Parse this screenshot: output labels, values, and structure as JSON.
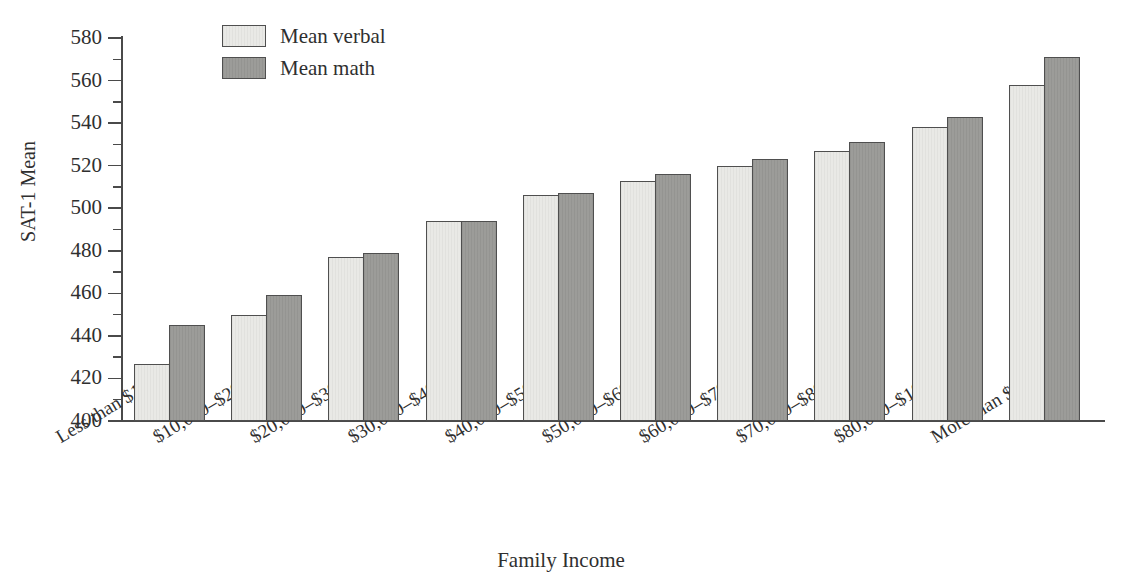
{
  "chart_data": {
    "type": "bar",
    "title": "",
    "xlabel": "Family Income",
    "ylabel": "SAT-1 Mean",
    "ylim": [
      400,
      580
    ],
    "ytick_step": 20,
    "yminor_step": 10,
    "grid": false,
    "legend_position": "top-left-inside",
    "categories": [
      "Less than $10,000",
      "$10,000–$20,000",
      "$20,000–$30,000",
      "$30,000–$40,000",
      "$40,000–$50,000",
      "$50,000–$60,000",
      "$60,000–$70,000",
      "$70,000–$80,000",
      "$80,000–$100,000",
      "More than $100,000"
    ],
    "ytick_labels": [
      "400",
      "420",
      "440",
      "460",
      "480",
      "500",
      "520",
      "540",
      "560",
      "580"
    ],
    "ytick_values": [
      400,
      420,
      440,
      460,
      480,
      500,
      520,
      540,
      560,
      580
    ],
    "series": [
      {
        "name": "Mean verbal",
        "color": "#e9e9e6",
        "values": [
          427,
          450,
          477,
          494,
          506,
          513,
          520,
          527,
          538,
          558
        ]
      },
      {
        "name": "Mean math",
        "color": "#9c9c99",
        "values": [
          445,
          459,
          479,
          494,
          507,
          516,
          523,
          531,
          543,
          571
        ]
      }
    ]
  },
  "legend": {
    "items": [
      {
        "label": "Mean verbal",
        "swatch": "verbal"
      },
      {
        "label": "Mean math",
        "swatch": "math"
      }
    ]
  },
  "axes": {
    "y_title": "SAT-1 Mean",
    "x_title": "Family Income"
  }
}
